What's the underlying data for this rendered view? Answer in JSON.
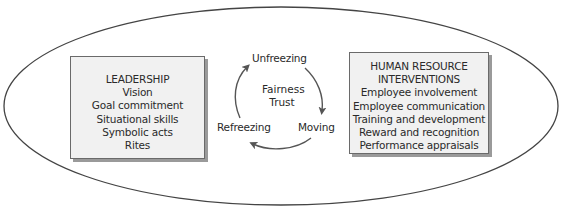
{
  "diagram": {
    "leadership": {
      "title": "LEADERSHIP",
      "items": [
        "Vision",
        "Goal commitment",
        "Situational skills",
        "Symbolic acts",
        "Rites"
      ]
    },
    "hr_interventions": {
      "title_line1": "HUMAN RESOURCE",
      "title_line2": "INTERVENTIONS",
      "items": [
        "Employee involvement",
        "Employee communication",
        "Training and development",
        "Reward and recognition",
        "Performance appraisals"
      ]
    },
    "cycle": {
      "stages": [
        "Unfreezing",
        "Moving",
        "Refreezing"
      ],
      "center": [
        "Fairness",
        "Trust"
      ]
    }
  }
}
